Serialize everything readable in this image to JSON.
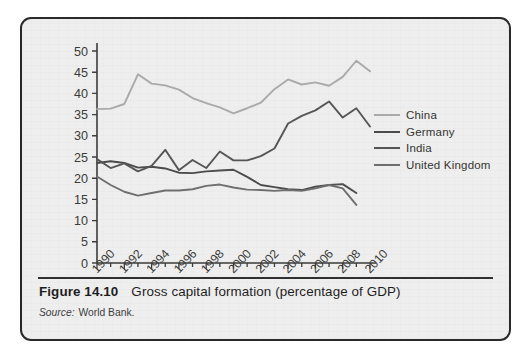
{
  "figure": {
    "number_label": "Figure 14.10",
    "title": "Gross capital formation (percentage of GDP)",
    "source_label": "Source:",
    "source_value": "World Bank."
  },
  "legend": {
    "items": [
      {
        "label": "China",
        "color": "#aaaaaa",
        "width": 2.0
      },
      {
        "label": "Germany",
        "color": "#4a4a4a",
        "width": 2.0
      },
      {
        "label": "India",
        "color": "#555555",
        "width": 2.0
      },
      {
        "label": "United Kingdom",
        "color": "#6e6e6e",
        "width": 2.0
      }
    ]
  },
  "axes": {
    "y_ticks": [
      "0",
      "5",
      "10",
      "15",
      "20",
      "25",
      "30",
      "35",
      "40",
      "45",
      "50"
    ],
    "x_ticks": [
      "1990",
      "1992",
      "1994",
      "1996",
      "1998",
      "2000",
      "2002",
      "2004",
      "2006",
      "2008",
      "2010"
    ]
  },
  "chart_data": {
    "type": "line",
    "title": "Gross capital formation (percentage of GDP)",
    "xlabel": "",
    "ylabel": "",
    "ylim": [
      0,
      50
    ],
    "xlim": [
      1990,
      2010
    ],
    "ytick_step": 5,
    "xtick_step": 2,
    "grid": false,
    "legend_position": "right",
    "x": [
      1990,
      1991,
      1992,
      1993,
      1994,
      1995,
      1996,
      1997,
      1998,
      1999,
      2000,
      2001,
      2002,
      2003,
      2004,
      2005,
      2006,
      2007,
      2008,
      2009,
      2010
    ],
    "series": [
      {
        "name": "China",
        "color": "#aaaaaa",
        "values": [
          36.3,
          36.4,
          37.5,
          44.5,
          42.3,
          41.9,
          40.9,
          38.9,
          37.7,
          36.7,
          35.3,
          36.5,
          37.8,
          41.0,
          43.3,
          42.1,
          42.6,
          41.8,
          43.9,
          47.7,
          45.2
        ]
      },
      {
        "name": "Germany",
        "color": "#4a4a4a",
        "values": [
          23.6,
          24.0,
          23.6,
          22.5,
          22.7,
          22.3,
          21.3,
          21.2,
          21.6,
          21.8,
          22.0,
          20.3,
          18.4,
          17.9,
          17.4,
          17.2,
          18.0,
          18.4,
          18.6,
          16.5,
          null
        ]
      },
      {
        "name": "India",
        "color": "#555555",
        "values": [
          24.5,
          22.4,
          23.5,
          21.6,
          22.9,
          26.7,
          21.9,
          24.3,
          22.4,
          26.3,
          24.2,
          24.2,
          25.2,
          27.0,
          32.9,
          34.7,
          36.0,
          38.1,
          34.3,
          36.5,
          32.2
        ]
      },
      {
        "name": "United Kingdom",
        "color": "#6e6e6e",
        "values": [
          20.4,
          18.4,
          16.8,
          15.9,
          16.5,
          17.1,
          17.1,
          17.4,
          18.2,
          18.5,
          17.8,
          17.3,
          17.2,
          17.0,
          17.2,
          17.0,
          17.6,
          18.4,
          17.6,
          13.7,
          null
        ]
      }
    ]
  }
}
